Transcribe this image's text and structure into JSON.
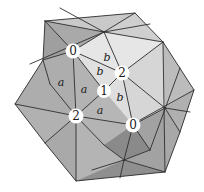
{
  "figure": {
    "type": "polyhedron-diagram",
    "colors": {
      "background": "#ffffff",
      "face_light": "#e4e4e4",
      "face_mid": "#bdbdbd",
      "face_dark": "#a4a4a4",
      "face_darker": "#8e8e8e",
      "edge": "#2e2e2e",
      "vertex_label_bg": "#ffffff"
    },
    "vertex_labels": [
      {
        "id": "v0-top",
        "text": "0",
        "x": 73,
        "y": 51
      },
      {
        "id": "v2-right",
        "text": "2",
        "x": 122,
        "y": 73
      },
      {
        "id": "v1-center",
        "text": "1",
        "x": 104,
        "y": 91
      },
      {
        "id": "v2-left",
        "text": "2",
        "x": 76,
        "y": 116
      },
      {
        "id": "v0-bottom",
        "text": "0",
        "x": 133,
        "y": 125
      }
    ],
    "face_labels": [
      {
        "id": "a1",
        "text": "a",
        "x": 61,
        "y": 82
      },
      {
        "id": "a2",
        "text": "a",
        "x": 84,
        "y": 89
      },
      {
        "id": "a3",
        "text": "a",
        "x": 100,
        "y": 110
      },
      {
        "id": "b1",
        "text": "b",
        "x": 107,
        "y": 57
      },
      {
        "id": "b2",
        "text": "b",
        "x": 100,
        "y": 71
      },
      {
        "id": "b3",
        "text": "b",
        "x": 120,
        "y": 97
      }
    ]
  }
}
